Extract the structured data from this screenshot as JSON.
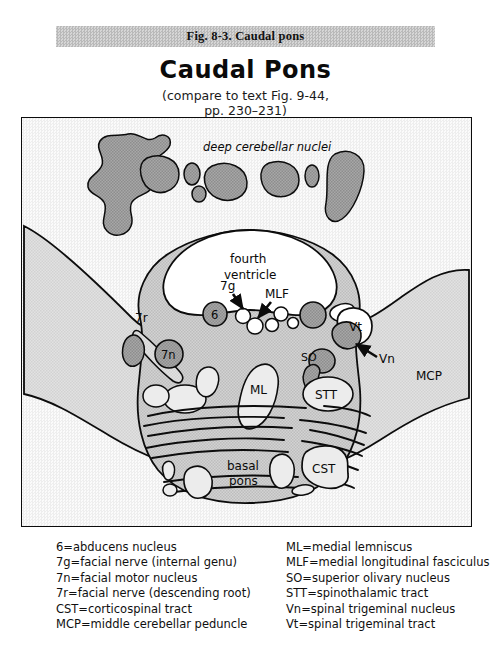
{
  "figure_caption": "Fig. 8-3. Caudal pons",
  "title": "Caudal Pons",
  "subtitle": {
    "line1": "(compare to text Fig. 9-44,",
    "line2": "pp. 230–231)"
  },
  "diagram": {
    "labels": {
      "deep_cerebellar_nuclei": "deep cerebellar nuclei",
      "fourth_ventricle_l1": "fourth",
      "fourth_ventricle_l2": "ventricle",
      "seven_g": "7g",
      "mlf": "MLF",
      "six": "6",
      "seven_r": "7r",
      "seven_n": "7n",
      "vt": "Vt",
      "vn": "Vn",
      "mcp": "MCP",
      "so": "SO",
      "ml": "ML",
      "stt": "STT",
      "cst": "CST",
      "basal_l1": "basal",
      "basal_l2": "pons"
    },
    "colors": {
      "outline": "#0c0c0c",
      "background_tint": "#f2f2f2",
      "tegmentum_fill": "#c9c9c9",
      "mcp_fill": "#dcdcdc",
      "nucleus_dark": "#9a9a9a",
      "ventricle_fill": "#ffffff",
      "tract_fill": "#e8e8e8"
    }
  },
  "legend": {
    "left": [
      "6=abducens nucleus",
      "7g=facial nerve (internal genu)",
      "7n=facial motor nucleus",
      "7r=facial nerve (descending root)",
      "CST=corticospinal tract",
      "MCP=middle cerebellar peduncle"
    ],
    "right": [
      "ML=medial lemniscus",
      "MLF=medial longitudinal fasciculus",
      "SO=superior olivary nucleus",
      "STT=spinothalamic tract",
      "Vn=spinal trigeminal nucleus",
      "Vt=spinal trigeminal tract"
    ]
  }
}
